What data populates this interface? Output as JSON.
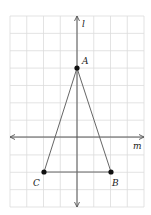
{
  "diagram": {
    "type": "coordinate-grid-figure",
    "grid": {
      "columns": 8,
      "rows": 11
    },
    "axes": {
      "vertical": {
        "label": "l"
      },
      "horizontal": {
        "label": "m"
      }
    },
    "points": [
      {
        "name": "A",
        "grid_x": 0,
        "grid_y": 4
      },
      {
        "name": "B",
        "grid_x": 2,
        "grid_y": -2
      },
      {
        "name": "C",
        "grid_x": -2,
        "grid_y": -2
      }
    ],
    "segments": [
      [
        "A",
        "B"
      ],
      [
        "B",
        "C"
      ],
      [
        "C",
        "A"
      ]
    ],
    "labels": {
      "A": "A",
      "B": "B",
      "C": "C",
      "l": "l",
      "m": "m"
    }
  }
}
